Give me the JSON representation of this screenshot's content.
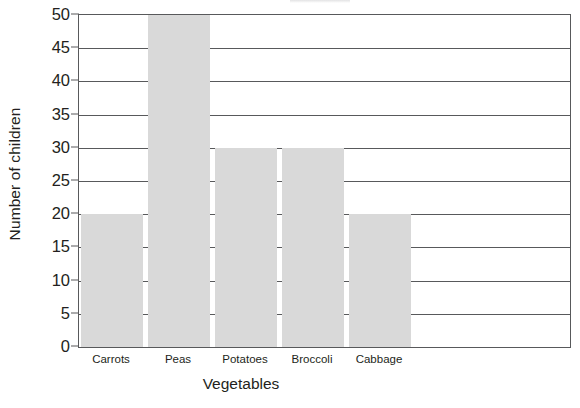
{
  "chart_data": {
    "type": "bar",
    "title": "",
    "xlabel": "Vegetables",
    "ylabel": "Number of children",
    "categories": [
      "Carrots",
      "Peas",
      "Potatoes",
      "Broccoli",
      "Cabbage"
    ],
    "values": [
      20,
      50,
      30,
      30,
      20
    ],
    "ylim": [
      0,
      50
    ],
    "ytick_labels": [
      "0",
      "5",
      "10",
      "15",
      "20",
      "25",
      "30",
      "35",
      "40",
      "45",
      "50"
    ],
    "ytick_values": [
      0,
      5,
      10,
      15,
      20,
      25,
      30,
      35,
      40,
      45,
      50
    ],
    "y_step": 5,
    "grid": "horizontal",
    "legend": "none",
    "bar_color": "#d9d9d9",
    "axis_color": "#58595b",
    "text_color": "#231f20",
    "plot_background": "#ffffff"
  }
}
